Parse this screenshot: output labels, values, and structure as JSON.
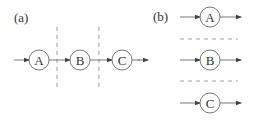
{
  "panel_a": {
    "label": "(a)",
    "nodes": [
      {
        "label": "A",
        "cx": 39,
        "cy": 60
      },
      {
        "label": "B",
        "cx": 80,
        "cy": 60
      },
      {
        "label": "C",
        "cx": 122,
        "cy": 60
      }
    ],
    "separators": [
      57,
      99
    ]
  },
  "panel_b": {
    "label": "(b)",
    "nodes": [
      {
        "label": "A",
        "cx": 210,
        "cy": 17
      },
      {
        "label": "B",
        "cx": 210,
        "cy": 60
      },
      {
        "label": "C",
        "cx": 210,
        "cy": 103
      }
    ],
    "separators": [
      39,
      81
    ]
  },
  "colors": {
    "stroke": "#555555",
    "dash": "#888888",
    "text": "#333333"
  }
}
